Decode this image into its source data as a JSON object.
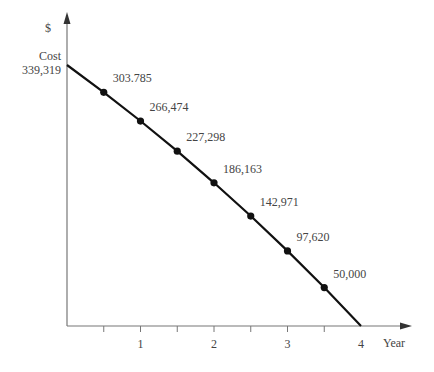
{
  "chart_data": {
    "type": "line",
    "title": "",
    "xlabel": "Year",
    "ylabel": "$",
    "y_start_label": "Cost",
    "xlim": [
      0,
      4
    ],
    "ylim": [
      0,
      339319
    ],
    "grid": false,
    "x_tick_labels": [
      "1",
      "2",
      "3",
      "4"
    ],
    "x_ticks": [
      0.5,
      1,
      1.5,
      2,
      2.5,
      3,
      3.5,
      4
    ],
    "start_point": {
      "x": 0,
      "y": 339319,
      "label": "339,319"
    },
    "end_point": {
      "x": 4,
      "y": 0
    },
    "points": [
      {
        "x": 0.5,
        "y": 303785,
        "label": "303.785"
      },
      {
        "x": 1.0,
        "y": 266474,
        "label": "266,474"
      },
      {
        "x": 1.5,
        "y": 227298,
        "label": "227,298"
      },
      {
        "x": 2.0,
        "y": 186163,
        "label": "186,163"
      },
      {
        "x": 2.5,
        "y": 142971,
        "label": "142,971"
      },
      {
        "x": 3.0,
        "y": 97620,
        "label": "97,620"
      },
      {
        "x": 3.5,
        "y": 50000,
        "label": "50,000"
      }
    ],
    "colors": {
      "curve": "#111111",
      "axis": "#777777",
      "text": "#444444"
    }
  }
}
